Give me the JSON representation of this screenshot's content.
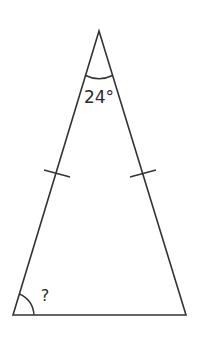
{
  "diagram": {
    "type": "isosceles-triangle",
    "apex_angle_label": "24°",
    "base_angle_label": "?",
    "equal_sides_marked": true,
    "stroke_color": "#333333"
  }
}
